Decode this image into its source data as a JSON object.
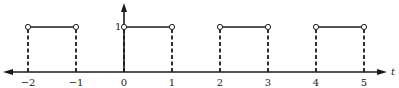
{
  "chart_data": {
    "type": "line",
    "title": "",
    "xlabel": "t",
    "ylabel": "",
    "x_ticks": [
      -2,
      -1,
      0,
      1,
      2,
      3,
      4,
      5
    ],
    "x_tick_labels": [
      "−2",
      "−1",
      "0",
      "1",
      "2",
      "3",
      "4",
      "5"
    ],
    "y_ticks": [
      1
    ],
    "y_tick_labels": [
      "1"
    ],
    "xlim": [
      -2.5,
      5.5
    ],
    "ylim": [
      0,
      1.5
    ],
    "grid": false,
    "legend": null,
    "series": [
      {
        "name": "pulse train",
        "segments": [
          {
            "x": [
              -2,
              -1
            ],
            "y": [
              1,
              1
            ]
          },
          {
            "x": [
              0,
              1
            ],
            "y": [
              1,
              1
            ]
          },
          {
            "x": [
              2,
              3
            ],
            "y": [
              1,
              1
            ]
          },
          {
            "x": [
              4,
              5
            ],
            "y": [
              1,
              1
            ]
          }
        ],
        "open_points": [
          [
            -2,
            1
          ],
          [
            -1,
            1
          ],
          [
            0,
            1
          ],
          [
            1,
            1
          ],
          [
            2,
            1
          ],
          [
            3,
            1
          ],
          [
            4,
            1
          ],
          [
            5,
            1
          ]
        ],
        "dashed_edges_at": [
          -2,
          -1,
          0,
          1,
          2,
          3,
          4,
          5
        ]
      }
    ]
  },
  "axis": {
    "x_label": "t",
    "y_tick_label": "1",
    "tick_labels": [
      "−2",
      "−1",
      "0",
      "1",
      "2",
      "3",
      "4",
      "5"
    ]
  },
  "colors": {
    "stroke": "#1a1a1a",
    "background": "#ffffff"
  }
}
